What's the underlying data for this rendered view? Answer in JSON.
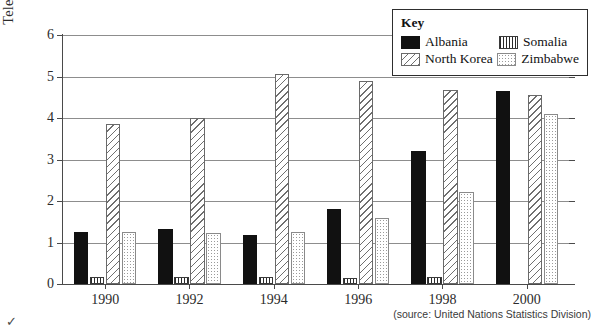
{
  "chart_data": {
    "type": "bar",
    "title": "",
    "xlabel": "",
    "ylabel": "Telephone lines / 100 people",
    "ylim": [
      0,
      6
    ],
    "yticks": [
      0,
      1,
      2,
      3,
      4,
      5,
      6
    ],
    "ytick_labels": [
      "0",
      "1",
      "2",
      "3",
      "4",
      "5",
      "6"
    ],
    "grid": true,
    "legend_position": "top-right",
    "legend_title": "Key",
    "categories": [
      "1990",
      "1992",
      "1994",
      "1996",
      "1998",
      "2000"
    ],
    "series": [
      {
        "name": "Albania",
        "pattern": "solid-black",
        "values": [
          1.25,
          1.33,
          1.18,
          1.8,
          3.2,
          4.65
        ]
      },
      {
        "name": "Somalia",
        "pattern": "vertical-stripes",
        "values": [
          0.18,
          0.17,
          0.18,
          0.15,
          0.17,
          0.0
        ]
      },
      {
        "name": "North Korea",
        "pattern": "diagonal-hatch",
        "values": [
          3.85,
          4.0,
          5.07,
          4.9,
          4.68,
          4.55
        ]
      },
      {
        "name": "Zimbabwe",
        "pattern": "light-dots",
        "values": [
          1.25,
          1.22,
          1.25,
          1.6,
          2.22,
          4.1
        ]
      }
    ],
    "source_note": "(source: United Nations Statistics Division)"
  },
  "legend": {
    "title": "Key",
    "entries": [
      {
        "label": "Albania",
        "swatch": "solid-black-swatch"
      },
      {
        "label": "Somalia",
        "swatch": "vertical-stripes-swatch"
      },
      {
        "label": "North Korea",
        "swatch": "diagonal-hatch-swatch"
      },
      {
        "label": "Zimbabwe",
        "swatch": "light-dots-swatch"
      }
    ]
  },
  "corner_mark": "✓"
}
